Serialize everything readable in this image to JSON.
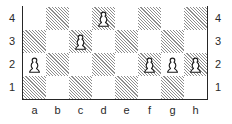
{
  "diagram": {
    "kind": "chess-board-diagram",
    "files": [
      "a",
      "b",
      "c",
      "d",
      "e",
      "f",
      "g",
      "h"
    ],
    "ranks_top_to_bottom": [
      "4",
      "3",
      "2",
      "1"
    ],
    "rank_labels_left": [
      "4",
      "3",
      "2",
      "1"
    ],
    "rank_labels_right": [
      "4",
      "3",
      "2",
      "1"
    ],
    "file_labels_bottom": [
      "a",
      "b",
      "c",
      "d",
      "e",
      "f",
      "g",
      "h"
    ],
    "colors": {
      "light_square": "#ffffff",
      "dark_square_hatch": "#8d8d8d",
      "border": "#262626",
      "label_text": "#2a2a2a",
      "piece_outline": "#1a1a1a",
      "piece_fill": "#ffffff"
    },
    "squares": [
      {
        "id": "a4",
        "file": "a",
        "rank": "4",
        "shade": "light"
      },
      {
        "id": "b4",
        "file": "b",
        "rank": "4",
        "shade": "dark"
      },
      {
        "id": "c4",
        "file": "c",
        "rank": "4",
        "shade": "light"
      },
      {
        "id": "d4",
        "file": "d",
        "rank": "4",
        "shade": "dark"
      },
      {
        "id": "e4",
        "file": "e",
        "rank": "4",
        "shade": "light"
      },
      {
        "id": "f4",
        "file": "f",
        "rank": "4",
        "shade": "dark"
      },
      {
        "id": "g4",
        "file": "g",
        "rank": "4",
        "shade": "light"
      },
      {
        "id": "h4",
        "file": "h",
        "rank": "4",
        "shade": "dark"
      },
      {
        "id": "a3",
        "file": "a",
        "rank": "3",
        "shade": "dark"
      },
      {
        "id": "b3",
        "file": "b",
        "rank": "3",
        "shade": "light"
      },
      {
        "id": "c3",
        "file": "c",
        "rank": "3",
        "shade": "dark"
      },
      {
        "id": "d3",
        "file": "d",
        "rank": "3",
        "shade": "light"
      },
      {
        "id": "e3",
        "file": "e",
        "rank": "3",
        "shade": "dark"
      },
      {
        "id": "f3",
        "file": "f",
        "rank": "3",
        "shade": "light"
      },
      {
        "id": "g3",
        "file": "g",
        "rank": "3",
        "shade": "dark"
      },
      {
        "id": "h3",
        "file": "h",
        "rank": "3",
        "shade": "light"
      },
      {
        "id": "a2",
        "file": "a",
        "rank": "2",
        "shade": "light"
      },
      {
        "id": "b2",
        "file": "b",
        "rank": "2",
        "shade": "dark"
      },
      {
        "id": "c2",
        "file": "c",
        "rank": "2",
        "shade": "light"
      },
      {
        "id": "d2",
        "file": "d",
        "rank": "2",
        "shade": "dark"
      },
      {
        "id": "e2",
        "file": "e",
        "rank": "2",
        "shade": "light"
      },
      {
        "id": "f2",
        "file": "f",
        "rank": "2",
        "shade": "dark"
      },
      {
        "id": "g2",
        "file": "g",
        "rank": "2",
        "shade": "light"
      },
      {
        "id": "h2",
        "file": "h",
        "rank": "2",
        "shade": "dark"
      },
      {
        "id": "a1",
        "file": "a",
        "rank": "1",
        "shade": "dark"
      },
      {
        "id": "b1",
        "file": "b",
        "rank": "1",
        "shade": "light"
      },
      {
        "id": "c1",
        "file": "c",
        "rank": "1",
        "shade": "dark"
      },
      {
        "id": "d1",
        "file": "d",
        "rank": "1",
        "shade": "light"
      },
      {
        "id": "e1",
        "file": "e",
        "rank": "1",
        "shade": "dark"
      },
      {
        "id": "f1",
        "file": "f",
        "rank": "1",
        "shade": "light"
      },
      {
        "id": "g1",
        "file": "g",
        "rank": "1",
        "shade": "dark"
      },
      {
        "id": "h1",
        "file": "h",
        "rank": "1",
        "shade": "light"
      }
    ],
    "pieces": [
      {
        "square": "d4",
        "color": "white",
        "type": "pawn",
        "icon": "white-pawn-icon",
        "col": 3,
        "row": 0
      },
      {
        "square": "c3",
        "color": "white",
        "type": "pawn",
        "icon": "white-pawn-icon",
        "col": 2,
        "row": 1
      },
      {
        "square": "a2",
        "color": "white",
        "type": "pawn",
        "icon": "white-pawn-icon",
        "col": 0,
        "row": 2
      },
      {
        "square": "f2",
        "color": "white",
        "type": "pawn",
        "icon": "white-pawn-icon",
        "col": 5,
        "row": 2
      },
      {
        "square": "g2",
        "color": "white",
        "type": "pawn",
        "icon": "white-pawn-icon",
        "col": 6,
        "row": 2
      },
      {
        "square": "h2",
        "color": "white",
        "type": "pawn",
        "icon": "white-pawn-icon",
        "col": 7,
        "row": 2
      }
    ]
  }
}
